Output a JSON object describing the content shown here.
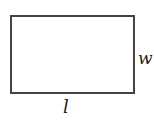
{
  "diagram": {
    "shape": "rectangle",
    "labels": {
      "width": "w",
      "length": "l"
    },
    "colors": {
      "stroke": "#444444",
      "text": "#222222",
      "background": "#ffffff"
    }
  }
}
